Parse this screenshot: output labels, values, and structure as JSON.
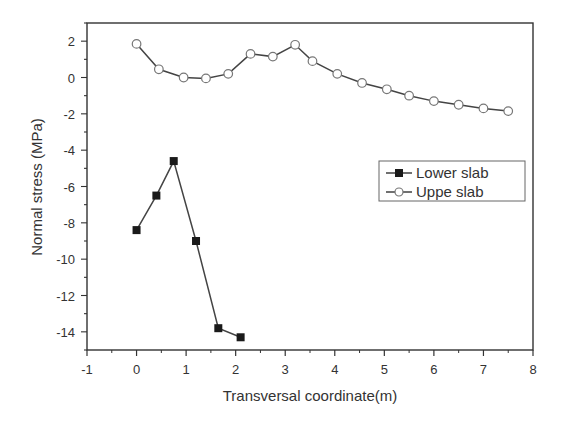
{
  "chart_data": {
    "type": "line",
    "title": "",
    "xlabel": "Transversal coordinate(m)",
    "ylabel": "Normal stress (MPa)",
    "xlim": [
      -1,
      8
    ],
    "ylim": [
      -15,
      3
    ],
    "xticks": [
      -1,
      0,
      1,
      2,
      3,
      4,
      5,
      6,
      7,
      8
    ],
    "yticks": [
      2,
      0,
      -2,
      -4,
      -6,
      -8,
      -10,
      -12,
      -14
    ],
    "grid": false,
    "legend_position": "center-right",
    "series": [
      {
        "name": "Lower slab",
        "marker": "filled-square",
        "x": [
          0,
          0.4,
          0.75,
          1.2,
          1.65,
          2.1
        ],
        "values": [
          -8.4,
          -6.5,
          -4.6,
          -9.0,
          -13.8,
          -14.3
        ]
      },
      {
        "name": "Uppe slab",
        "marker": "open-circle",
        "x": [
          0,
          0.45,
          0.95,
          1.4,
          1.85,
          2.3,
          2.75,
          3.2,
          3.55,
          4.05,
          4.55,
          5.05,
          5.5,
          6.0,
          6.5,
          7.0,
          7.5
        ],
        "values": [
          1.85,
          0.45,
          0.0,
          -0.05,
          0.2,
          1.3,
          1.15,
          1.8,
          0.9,
          0.2,
          -0.3,
          -0.65,
          -1.0,
          -1.3,
          -1.5,
          -1.7,
          -1.85
        ]
      }
    ]
  },
  "colors": {
    "line": "#444444",
    "marker_fill_lower": "#1a1a1a",
    "marker_fill_upper": "#ffffff",
    "marker_stroke_upper": "#777777"
  }
}
